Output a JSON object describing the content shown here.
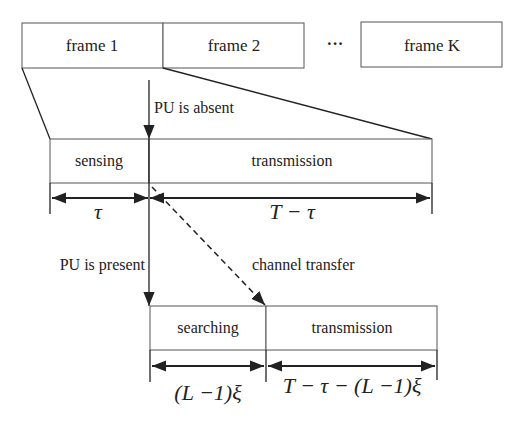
{
  "frames": {
    "frame1": "frame 1",
    "frame2": "frame 2",
    "ellipsis": "···",
    "frameK": "frame K"
  },
  "annotations": {
    "pu_absent": "PU is absent",
    "pu_present": "PU is present",
    "channel_transfer": "channel transfer"
  },
  "sensing_row": {
    "sensing": "sensing",
    "transmission": "transmission",
    "dim_sensing": "τ",
    "dim_transmission": "T − τ"
  },
  "searching_row": {
    "searching": "searching",
    "transmission": "transmission",
    "dim_searching": "(L −1)ξ",
    "dim_transmission": "T − τ − (L −1)ξ"
  },
  "colors": {
    "stroke": "#222222",
    "box_stroke": "#555555",
    "background": "#ffffff"
  }
}
